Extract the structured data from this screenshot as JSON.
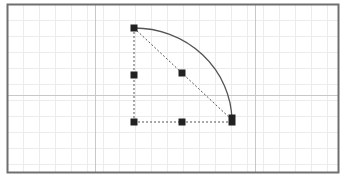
{
  "canvas": {
    "width": 345,
    "height": 176,
    "background": "#ffffff",
    "frame": {
      "x": 7.5,
      "y": 4.5,
      "width": 331,
      "height": 168,
      "color": "#6f6f6f"
    },
    "grid": {
      "minor_spacing": 16,
      "minor_color": "#ececec",
      "major_color": "#c8c8c8",
      "major_vertical_x": [
        95.5,
        255.5
      ],
      "major_horizontal_y": [
        95.5
      ],
      "origin_x": 7.5,
      "origin_y": 4.5
    }
  },
  "shape": {
    "type": "quarter-circle-sector",
    "center": {
      "x": 134,
      "y": 122
    },
    "arc": {
      "start": {
        "x": 134,
        "y": 28
      },
      "end": {
        "x": 232,
        "y": 120
      },
      "rx": 98,
      "ry": 94,
      "color": "#555555"
    },
    "guides": {
      "color": "#555555",
      "dash": "2,2",
      "lines": [
        {
          "name": "radius-vertical",
          "x1": 134,
          "y1": 28,
          "x2": 134,
          "y2": 122
        },
        {
          "name": "radius-horizontal",
          "x1": 134,
          "y1": 122,
          "x2": 232,
          "y2": 122
        },
        {
          "name": "chord",
          "x1": 134,
          "y1": 28,
          "x2": 232,
          "y2": 120
        }
      ]
    },
    "handles": {
      "color": "#222222",
      "items": [
        {
          "name": "handle-top",
          "x": 134,
          "y": 28,
          "w": 7,
          "h": 7
        },
        {
          "name": "handle-left-mid",
          "x": 134,
          "y": 75,
          "w": 7,
          "h": 7
        },
        {
          "name": "handle-center",
          "x": 182,
          "y": 73,
          "w": 7,
          "h": 7
        },
        {
          "name": "handle-origin",
          "x": 134,
          "y": 122,
          "w": 7,
          "h": 7
        },
        {
          "name": "handle-bottom-mid",
          "x": 182,
          "y": 122,
          "w": 7,
          "h": 7
        },
        {
          "name": "handle-arc-end",
          "x": 232,
          "y": 120,
          "w": 7,
          "h": 11
        }
      ]
    }
  }
}
